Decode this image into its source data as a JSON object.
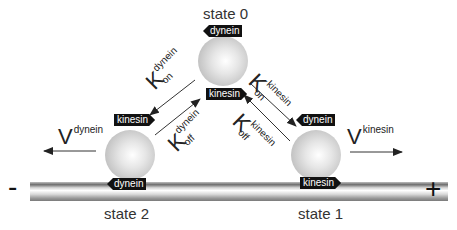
{
  "states": [
    {
      "label": "state 0",
      "top_tag": "dynein",
      "bottom_tag": "kinesin"
    },
    {
      "label": "state 1",
      "top_tag": "dynein",
      "bottom_tag": "kinesin"
    },
    {
      "label": "state 2",
      "top_tag": "kinesin",
      "bottom_tag": "dynein"
    }
  ],
  "rates": {
    "k_on_dynein": {
      "symbol": "K",
      "sup": "dynein",
      "sub": "on"
    },
    "k_off_dynein": {
      "symbol": "K",
      "sup": "dynein",
      "sub": "off"
    },
    "k_on_kinesin": {
      "symbol": "K",
      "sup": "kinesin",
      "sub": "on"
    },
    "k_off_kinesin": {
      "symbol": "K",
      "sup": "kinesin",
      "sub": "off"
    }
  },
  "velocities": {
    "dynein": {
      "symbol": "V",
      "sup": "dynein"
    },
    "kinesin": {
      "symbol": "V",
      "sup": "kinesin"
    }
  },
  "polarity": {
    "minus": "-",
    "plus": "+"
  },
  "colors": {
    "tag_bg": "#111111",
    "tag_text": "#ffffff",
    "arrow": "#222222"
  }
}
